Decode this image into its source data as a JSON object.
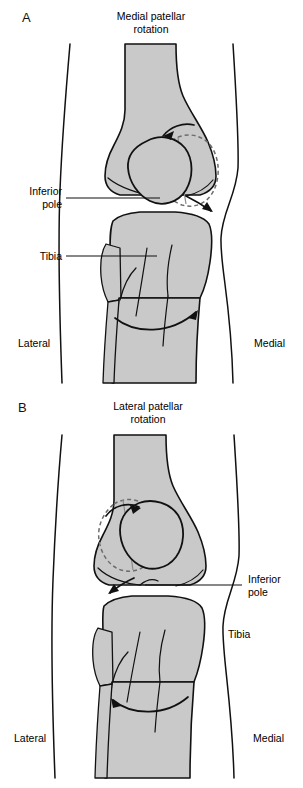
{
  "figure": {
    "type": "anatomical-illustration",
    "background_color": "#ffffff",
    "bone_fill_color": "#c9c9c9",
    "outline_color": "#111111",
    "dashed_outline_color": "#6d6d6d"
  },
  "panels": [
    {
      "letter": "A",
      "title_line1": "Medial patellar",
      "title_line2": "rotation",
      "labels": {
        "inferior_pole_line1": "Inferior",
        "inferior_pole_line2": "pole",
        "tibia": "Tibia",
        "lateral": "Lateral",
        "medial": "Medial"
      },
      "rotation_direction": "medial",
      "patella_original": "solid outline (left / central position)",
      "patella_rotated": "dashed outline (rotated medially, to the right)",
      "arrows": [
        "curved arrow at superior patella pointing left-to-right-down",
        "curved arrow at inferior pole pointing down-right",
        "curved arrow around tibia pointing medially (to the right)"
      ]
    },
    {
      "letter": "B",
      "title_line1": "Lateral patellar",
      "title_line2": "rotation",
      "labels": {
        "inferior_pole_line1": "Inferior",
        "inferior_pole_line2": "pole",
        "tibia": "Tibia",
        "lateral": "Lateral",
        "medial": "Medial"
      },
      "rotation_direction": "lateral",
      "patella_original": "solid outline (right / central position)",
      "patella_rotated": "dashed outline (rotated laterally, to the left)",
      "arrows": [
        "curved arrow at superior patella pointing left-to-right",
        "curved arrow at inferior pole pointing down-left",
        "curved arrow around tibia pointing laterally (to the left)"
      ]
    }
  ]
}
